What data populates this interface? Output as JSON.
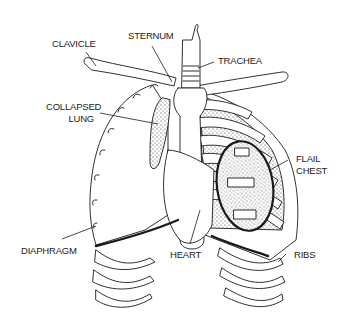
{
  "diagram": {
    "labels": {
      "clavicle": "CLAVICLE",
      "sternum": "STERNUM",
      "trachea": "TRACHEA",
      "collapsed_lung_1": "COLLAPSED",
      "collapsed_lung_2": "LUNG",
      "flail_chest_1": "FLAIL",
      "flail_chest_2": "CHEST",
      "diaphragm": "DIAPHRAGM",
      "heart": "HEART",
      "ribs": "RIBS"
    },
    "colors": {
      "line": "#1a1a1a",
      "background": "#ffffff",
      "lung_fill": "#d9d9d9"
    }
  }
}
